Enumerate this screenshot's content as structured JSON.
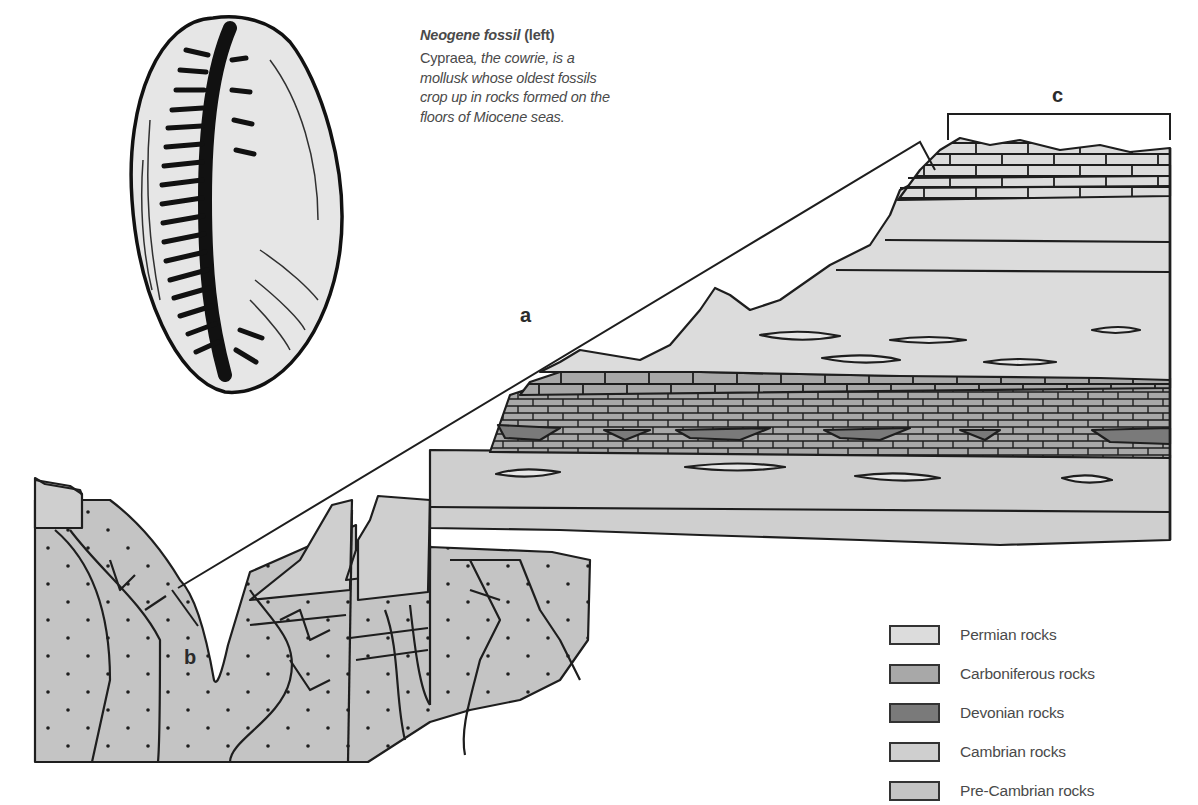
{
  "caption": {
    "title_italic": "Neogene fossil",
    "title_suffix": "(left)",
    "genus": "Cypraea",
    "body_rest": ", the cowrie, is a mollusk whose oldest fossils crop up in rocks formed on the floors of Miocene seas."
  },
  "labels": {
    "a": "a",
    "b": "b",
    "c": "c"
  },
  "legend": {
    "items": [
      {
        "label": "Permian rocks",
        "color": "#dcdcdc"
      },
      {
        "label": "Carboniferous rocks",
        "color": "#a8a8a8"
      },
      {
        "label": "Devonian rocks",
        "color": "#7a7a7a"
      },
      {
        "label": "Cambrian rocks",
        "color": "#cfcfcf"
      },
      {
        "label": "Pre-Cambrian rocks",
        "color": "#c4c4c4"
      }
    ]
  },
  "colors": {
    "outline": "#1e1e1e",
    "permian": "#dcdcdc",
    "carboniferous": "#a8a8a8",
    "devonian": "#7a7a7a",
    "cambrian": "#cfcfcf",
    "precambrian": "#c4c4c4",
    "shell_fill": "#e6e6e6",
    "text": "#4a4a4a"
  }
}
